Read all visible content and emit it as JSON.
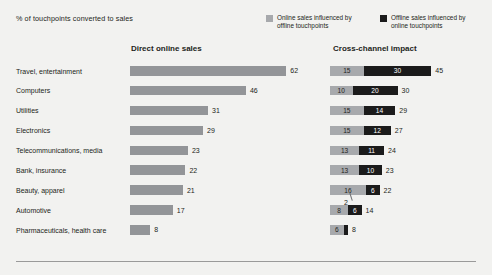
{
  "header": {
    "subtitle": "% of touchpoints converted to sales"
  },
  "legend": {
    "items": [
      {
        "label": "Online sales influenced by offline touchpoints",
        "color": "#a7a9ac",
        "icon": "legend-swatch-online"
      },
      {
        "label": "Offline sales influenced by online touchpoints",
        "color": "#1b1b1b",
        "icon": "legend-swatch-offline"
      }
    ]
  },
  "sections": {
    "left_title": "Direct online sales",
    "right_title": "Cross-channel impact"
  },
  "callout": {
    "value": "2"
  },
  "chart_data": {
    "type": "bar",
    "title": "% of touchpoints converted to sales",
    "subtitle": "",
    "xlabel": "",
    "ylabel": "",
    "grid": false,
    "legend_position": "top-right",
    "categories": [
      "Travel, entertainment",
      "Computers",
      "Utilities",
      "Electronics",
      "Telecommunications, media",
      "Bank, insurance",
      "Beauty, apparel",
      "Automotive",
      "Pharmaceuticals, health care"
    ],
    "panels": [
      {
        "name": "Direct online sales",
        "type": "bar",
        "orientation": "horizontal",
        "series": [
          {
            "name": "Direct online sales",
            "color": "#939598",
            "values": [
              62,
              46,
              31,
              29,
              23,
              22,
              21,
              17,
              8
            ]
          }
        ],
        "xlim": [
          0,
          62
        ]
      },
      {
        "name": "Cross-channel impact",
        "type": "bar",
        "stacked": true,
        "orientation": "horizontal",
        "series": [
          {
            "name": "Online sales influenced by offline touchpoints",
            "color": "#a7a9ac",
            "values": [
              15,
              10,
              15,
              15,
              13,
              13,
              16,
              8,
              6
            ]
          },
          {
            "name": "Offline sales influenced by online touchpoints",
            "color": "#1b1b1b",
            "values": [
              30,
              20,
              14,
              12,
              11,
              10,
              6,
              6,
              2
            ]
          }
        ],
        "totals": [
          45,
          30,
          29,
          27,
          24,
          23,
          22,
          14,
          8
        ],
        "xlim": [
          0,
          45
        ]
      }
    ]
  }
}
